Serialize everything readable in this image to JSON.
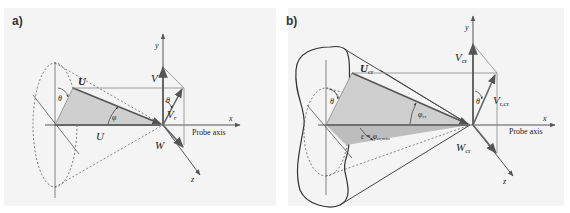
{
  "panels": [
    {
      "label": "a)",
      "labels": {
        "y_axis": "y",
        "x_axis": "x",
        "z_axis": "z",
        "probe_axis": "Probe axis",
        "U_vec": "U",
        "U_axial": "U",
        "V": "V",
        "Vr": "V",
        "Vr_sub": "r",
        "W": "W",
        "theta_left": "θ",
        "theta_right": "θ",
        "phi": "φ"
      }
    },
    {
      "label": "b)",
      "labels": {
        "y_axis": "y",
        "x_axis": "x",
        "z_axis": "z",
        "probe_axis": "Probe axis",
        "U_vec": "U",
        "U_sub": "cr",
        "V": "V",
        "V_sub": "cr",
        "Vr": "V",
        "Vr_sub": "r,cr",
        "W": "W",
        "W_sub": "cr",
        "theta_left": "θ",
        "theta_right": "θ",
        "phi": "φ",
        "phi_sub": "cr",
        "epsilon": "ε = φ",
        "epsilon_sub": "cr,min"
      }
    }
  ],
  "colors": {
    "panel_bg": "#f4f4f4",
    "shade": "#cfcfcf",
    "shade_dark": "#bdbdbd",
    "line": "#555555",
    "arrow": "#666666"
  }
}
